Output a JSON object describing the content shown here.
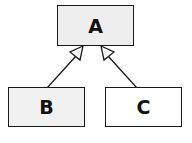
{
  "diagram": {
    "type": "uml-class-inheritance",
    "nodes": [
      {
        "id": "A",
        "label": "A",
        "fill": "#eeeeee",
        "role": "parent"
      },
      {
        "id": "B",
        "label": "B",
        "fill": "#f1f1f1",
        "role": "child"
      },
      {
        "id": "C",
        "label": "C",
        "fill": "#ffffff",
        "role": "child"
      }
    ],
    "edges": [
      {
        "from": "B",
        "to": "A",
        "arrow": "hollow-triangle"
      },
      {
        "from": "C",
        "to": "A",
        "arrow": "hollow-triangle"
      }
    ],
    "colors": {
      "stroke": "#1a1a1a"
    }
  }
}
